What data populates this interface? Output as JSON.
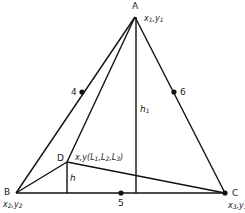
{
  "diagram": {
    "vertices": [
      {
        "id": "A",
        "label": "A",
        "coord_label": "x1,y1",
        "x": 135,
        "y": 17
      },
      {
        "id": "B",
        "label": "B",
        "coord_label": "x2,y2",
        "x": 16,
        "y": 193
      },
      {
        "id": "C",
        "label": "C",
        "coord_label": "x3,y3",
        "x": 225,
        "y": 193
      }
    ],
    "interior_point": {
      "label": "D",
      "coord_label": "x,y(L1,L2,L3)",
      "x": 67,
      "y": 162
    },
    "midside_nodes": [
      {
        "label": "4",
        "x": 82,
        "y": 92
      },
      {
        "label": "5",
        "x": 121,
        "y": 193
      },
      {
        "label": "6",
        "x": 174,
        "y": 92
      }
    ],
    "heights": [
      {
        "label": "h1",
        "from": "A",
        "foot_x": 136,
        "foot_y": 193
      },
      {
        "label": "h",
        "from": "D",
        "foot_x": 67,
        "foot_y": 193
      }
    ],
    "line_color": "#111111"
  }
}
